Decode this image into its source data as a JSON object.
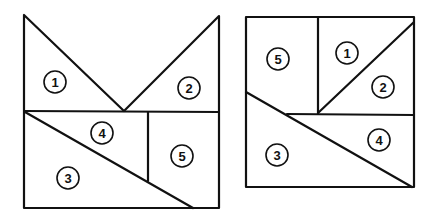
{
  "figures": [
    {
      "name": "left-figure",
      "pieces": [
        {
          "label": "1",
          "x": 55,
          "y": 82
        },
        {
          "label": "2",
          "x": 189,
          "y": 88
        },
        {
          "label": "4",
          "x": 102,
          "y": 133
        },
        {
          "label": "5",
          "x": 182,
          "y": 156
        },
        {
          "label": "3",
          "x": 68,
          "y": 178
        }
      ]
    },
    {
      "name": "right-figure",
      "pieces": [
        {
          "label": "5",
          "x": 278,
          "y": 59
        },
        {
          "label": "1",
          "x": 347,
          "y": 53
        },
        {
          "label": "2",
          "x": 383,
          "y": 87
        },
        {
          "label": "4",
          "x": 379,
          "y": 140
        },
        {
          "label": "3",
          "x": 277,
          "y": 155
        }
      ]
    }
  ]
}
